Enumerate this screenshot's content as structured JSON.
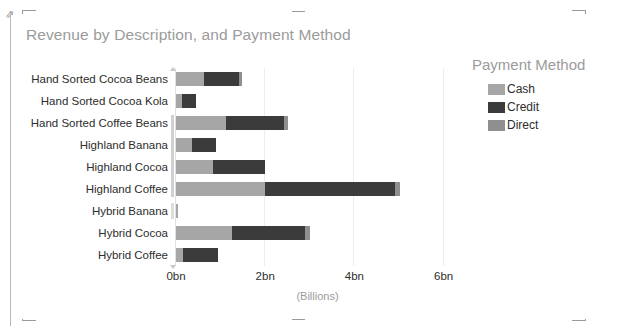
{
  "visual": {
    "title": "Revenue by Description, and Payment Method"
  },
  "legend": {
    "title": "Payment Method",
    "items": [
      {
        "label": "Cash",
        "color": "#a6a6a6"
      },
      {
        "label": "Credit",
        "color": "#3b3b3b"
      },
      {
        "label": "Direct",
        "color": "#8f8f8f"
      }
    ]
  },
  "axis": {
    "x_title": "(Billions)",
    "x_ticks": [
      "0bn",
      "2bn",
      "4bn",
      "6bn"
    ]
  },
  "chart_data": {
    "type": "bar",
    "orientation": "horizontal",
    "stacked": true,
    "title": "Revenue by Description, and Payment Method",
    "xlabel": "(Billions)",
    "ylabel": "",
    "xlim": [
      0,
      6.8
    ],
    "xticks": [
      0,
      2,
      4,
      6
    ],
    "xticklabels": [
      "0bn",
      "2bn",
      "4bn",
      "6bn"
    ],
    "grid": "vertical",
    "legend_position": "right",
    "legend_title": "Payment Method",
    "categories": [
      "Hand Sorted Cocoa Beans",
      "Hand Sorted Cocoa Kola",
      "Hand Sorted Coffee Beans",
      "Highland Banana",
      "Highland Cocoa",
      "Highland Coffee",
      "Hybrid Banana",
      "Hybrid Cocoa",
      "Hybrid Coffee"
    ],
    "series": [
      {
        "name": "Cash",
        "color": "#a6a6a6",
        "values": [
          0.62,
          0.14,
          1.12,
          0.36,
          0.83,
          2.0,
          0.01,
          1.26,
          0.16
        ]
      },
      {
        "name": "Credit",
        "color": "#3b3b3b",
        "values": [
          0.8,
          0.31,
          1.3,
          0.54,
          1.17,
          2.92,
          0.0,
          1.64,
          0.79
        ]
      },
      {
        "name": "Direct",
        "color": "#8f8f8f",
        "values": [
          0.07,
          0.0,
          0.09,
          0.0,
          0.0,
          0.11,
          0.0,
          0.11,
          0.0
        ]
      }
    ],
    "totals": [
      1.49,
      0.45,
      2.51,
      0.9,
      2.0,
      5.03,
      0.01,
      3.01,
      0.95
    ]
  }
}
